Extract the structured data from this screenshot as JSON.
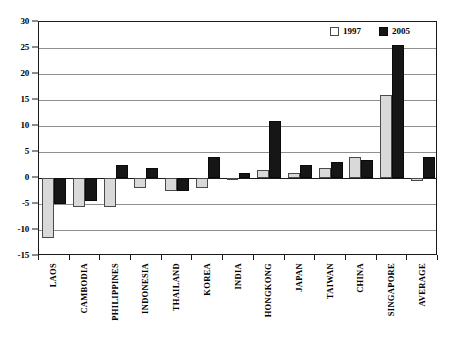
{
  "chart_data": {
    "type": "bar",
    "title": "",
    "subtitle": "",
    "xlabel": "",
    "ylabel": "",
    "ylim": [
      -15,
      30
    ],
    "ytick_step": 5,
    "yticks": [
      30,
      25,
      20,
      15,
      10,
      5,
      0,
      -5,
      -10,
      -15
    ],
    "ytick_labels": [
      "30",
      "25",
      "20",
      "15",
      "10",
      "5",
      "0",
      "-5",
      "-10",
      "-15"
    ],
    "grid": true,
    "legend_position": "top-right",
    "categories": [
      "LAOS",
      "CAMBODIA",
      "PHILIPPINES",
      "INDONESIA",
      "THAILAND",
      "KOREA",
      "INDIA",
      "HONGKONG",
      "JAPAN",
      "TAIWAN",
      "CHINA",
      "SINGAPORE",
      "AVERAGE"
    ],
    "series": [
      {
        "name": "1997",
        "color": "#d9d9d9",
        "values": [
          -11.5,
          -5.5,
          -5.5,
          -2.0,
          -2.5,
          -2.0,
          -0.3,
          1.5,
          1.0,
          2.0,
          4.0,
          16.0,
          -0.5
        ]
      },
      {
        "name": "2005",
        "color": "#161616",
        "values": [
          -5.0,
          -4.5,
          2.5,
          2.0,
          -2.5,
          4.0,
          1.0,
          11.0,
          2.5,
          3.0,
          3.5,
          25.5,
          4.0
        ]
      }
    ]
  },
  "legend": {
    "entries": [
      {
        "label": "1997",
        "swatch": "light-square-icon"
      },
      {
        "label": "2005",
        "swatch": "dark-square-icon"
      }
    ]
  }
}
